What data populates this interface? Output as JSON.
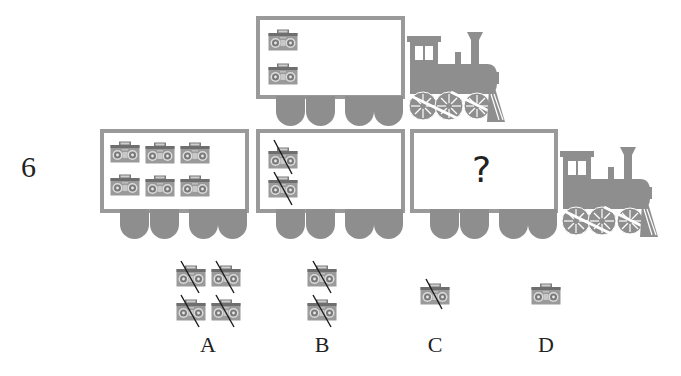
{
  "question": {
    "number": "6",
    "unknown_symbol": "?"
  },
  "colors": {
    "train_gray": "#8e8e8e",
    "frame_gray": "#9a9a9a",
    "text": "#222222",
    "strike": "#1a1a1a"
  },
  "top_train": {
    "car": {
      "boomboxes": 2,
      "crossed": 0
    },
    "locomotive": "locomotive-icon"
  },
  "bottom_train": {
    "cars": [
      {
        "boomboxes": 6,
        "crossed": 0
      },
      {
        "boomboxes": 2,
        "crossed": 2
      },
      {
        "content": "?"
      }
    ],
    "locomotive": "locomotive-icon"
  },
  "options": [
    {
      "label": "A",
      "boomboxes": 4,
      "crossed": 4
    },
    {
      "label": "B",
      "boomboxes": 2,
      "crossed": 2
    },
    {
      "label": "C",
      "boomboxes": 1,
      "crossed": 1
    },
    {
      "label": "D",
      "boomboxes": 1,
      "crossed": 0
    }
  ]
}
